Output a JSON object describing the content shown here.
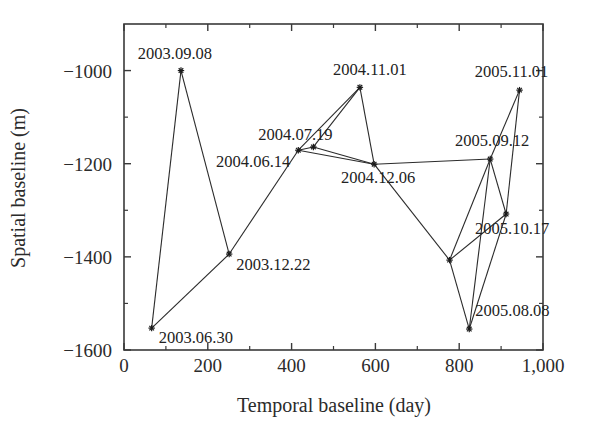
{
  "chart_data": {
    "type": "scatter",
    "title": "",
    "xlabel": "Temporal baseline (day)",
    "ylabel": "Spatial baseline (m)",
    "xlim": [
      0,
      1000
    ],
    "ylim": [
      -1600,
      -900
    ],
    "grid": false,
    "legend": null,
    "xticks": [
      {
        "value": 0,
        "label": "0"
      },
      {
        "value": 200,
        "label": "200"
      },
      {
        "value": 400,
        "label": "400"
      },
      {
        "value": 600,
        "label": "600"
      },
      {
        "value": 800,
        "label": "800"
      },
      {
        "value": 1000,
        "label": "1,000"
      }
    ],
    "xticks_minor": [
      100,
      300,
      500,
      700,
      900
    ],
    "yticks": [
      {
        "value": -1000,
        "label": "-1000"
      },
      {
        "value": -1200,
        "label": "-1200"
      },
      {
        "value": -1400,
        "label": "-1400"
      },
      {
        "value": -1600,
        "label": "-1600"
      }
    ],
    "yticks_minor": [
      -1100,
      -1300,
      -1500
    ],
    "points": [
      {
        "id": "p1",
        "label": "2003.06.30",
        "x": 66,
        "y": -1553,
        "label_dx": 7,
        "label_dy": 15,
        "label_anchor": "start"
      },
      {
        "id": "p2",
        "label": "2003.09.08",
        "x": 136,
        "y": -1000,
        "label_dx": -6,
        "label_dy": -12,
        "label_anchor": "middle"
      },
      {
        "id": "p3",
        "label": "2003.12.22",
        "x": 251,
        "y": -1394,
        "label_dx": 7,
        "label_dy": 16,
        "label_anchor": "start"
      },
      {
        "id": "p4",
        "label": "2004.06.14",
        "x": 416,
        "y": -1171,
        "label_dx": -8,
        "label_dy": 17,
        "label_anchor": "end"
      },
      {
        "id": "p5",
        "label": "2004.07.19",
        "x": 452,
        "y": -1164,
        "label_dx": -18,
        "label_dy": -7,
        "label_anchor": "middle"
      },
      {
        "id": "p6",
        "label": "2004.11.01",
        "x": 563,
        "y": -1036,
        "label_dx": 10,
        "label_dy": -12,
        "label_anchor": "middle"
      },
      {
        "id": "p7",
        "label": "2004.12.06",
        "x": 597,
        "y": -1201,
        "label_dx": 4,
        "label_dy": 19,
        "label_anchor": "middle"
      },
      {
        "id": "p8",
        "label": "2005.08.08",
        "x": 824,
        "y": -1555,
        "label_dx": 6,
        "label_dy": -13,
        "label_anchor": "start"
      },
      {
        "id": "p9",
        "label": "2005.09.12",
        "x": 874,
        "y": -1190,
        "label_dx": 2,
        "label_dy": -13,
        "label_anchor": "middle"
      },
      {
        "id": "p10",
        "label": "2005.10.17",
        "x": 912,
        "y": -1308,
        "label_dx": 6,
        "label_dy": 20,
        "label_anchor": "middle"
      },
      {
        "id": "p11",
        "label": "2005.11.01",
        "x": 944,
        "y": -1042,
        "label_dx": -8,
        "label_dy": -13,
        "label_anchor": "middle"
      },
      {
        "id": "p12",
        "label": "",
        "x": 777,
        "y": -1407,
        "label_dx": 0,
        "label_dy": 0,
        "label_anchor": "middle"
      }
    ],
    "edges": [
      [
        "p1",
        "p2"
      ],
      [
        "p1",
        "p3"
      ],
      [
        "p2",
        "p3"
      ],
      [
        "p3",
        "p4"
      ],
      [
        "p4",
        "p5"
      ],
      [
        "p4",
        "p6"
      ],
      [
        "p4",
        "p7"
      ],
      [
        "p5",
        "p6"
      ],
      [
        "p5",
        "p7"
      ],
      [
        "p6",
        "p7"
      ],
      [
        "p7",
        "p9"
      ],
      [
        "p7",
        "p12"
      ],
      [
        "p8",
        "p9"
      ],
      [
        "p8",
        "p10"
      ],
      [
        "p9",
        "p10"
      ],
      [
        "p9",
        "p11"
      ],
      [
        "p10",
        "p11"
      ],
      [
        "p12",
        "p8"
      ],
      [
        "p12",
        "p9"
      ],
      [
        "p12",
        "p10"
      ]
    ]
  }
}
